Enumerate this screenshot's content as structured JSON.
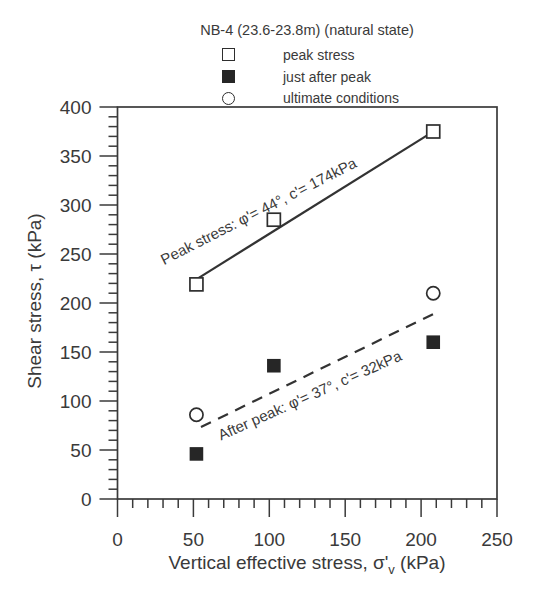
{
  "colors": {
    "background": "#ffffff",
    "ink": "#3a3a3a",
    "trend_line": "#333333",
    "marker_stroke": "#2e2e2e",
    "marker_fill": "#262626"
  },
  "chart_data": {
    "type": "scatter",
    "title": "NB-4 (23.6-23.8m) (natural state)",
    "xlabel": {
      "pre": "Vertical effective stress, ",
      "symbol": "σ'",
      "subscript": "v",
      "post": " (kPa)"
    },
    "ylabel": "Shear stress, τ (kPa)",
    "xlim": [
      0,
      250
    ],
    "ylim": [
      0,
      400
    ],
    "x_major_ticks": [
      0,
      50,
      100,
      150,
      200,
      250
    ],
    "y_major_ticks": [
      0,
      50,
      100,
      150,
      200,
      250,
      300,
      350,
      400
    ],
    "minor_tick_step": 10,
    "grid": false,
    "legend_position": "top-center",
    "series": [
      {
        "name": "peak stress",
        "marker": "open-square",
        "points": [
          [
            52,
            219
          ],
          [
            103,
            285
          ],
          [
            208,
            375
          ]
        ]
      },
      {
        "name": "just after peak",
        "marker": "filled-square",
        "points": [
          [
            52,
            46
          ],
          [
            103,
            136
          ],
          [
            208,
            160
          ]
        ]
      },
      {
        "name": "ultimate conditions",
        "marker": "open-circle",
        "points": [
          [
            52,
            86
          ],
          [
            208,
            210
          ]
        ]
      }
    ],
    "trend_lines": [
      {
        "name": "peak-stress-envelope",
        "style": "solid",
        "cohesion_kpa": 174,
        "friction_angle_deg": 44,
        "x_range": [
          53,
          209
        ]
      },
      {
        "name": "after-peak-envelope",
        "style": "dashed",
        "cohesion_kpa": 32,
        "friction_angle_deg": 37,
        "x_range": [
          55,
          211
        ]
      }
    ],
    "annotations": [
      {
        "text": "Peak stress: φ'= 44°, c'= 174kPa",
        "x": 94.5,
        "y": 289,
        "angle_deg": -27
      },
      {
        "text": "After peak: φ'= 37°, c'= 32kPa",
        "x": 128.1,
        "y": 101,
        "angle_deg": -24
      }
    ]
  }
}
